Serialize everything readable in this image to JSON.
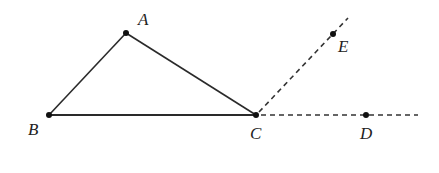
{
  "diagram": {
    "points": {
      "A": {
        "label": "A",
        "x": 126,
        "y": 33,
        "label_x": 138,
        "label_y": 25
      },
      "B": {
        "label": "B",
        "x": 49,
        "y": 115,
        "label_x": 28,
        "label_y": 135
      },
      "C": {
        "label": "C",
        "x": 256,
        "y": 115,
        "label_x": 250,
        "label_y": 139
      },
      "D": {
        "label": "D",
        "x": 366,
        "y": 115,
        "label_x": 360,
        "label_y": 139
      },
      "E": {
        "label": "E",
        "x": 333,
        "y": 34,
        "label_x": 338,
        "label_y": 52
      }
    },
    "segments": [
      {
        "from": "A",
        "to": "B",
        "style": "solid"
      },
      {
        "from": "A",
        "to": "C",
        "style": "solid"
      },
      {
        "from": "B",
        "to": "C",
        "style": "solid"
      }
    ],
    "rays": [
      {
        "from": "C",
        "through": "E",
        "end_x": 348,
        "end_y": 18,
        "style": "dashed"
      },
      {
        "from": "C",
        "through": "D",
        "end_x": 418,
        "end_y": 115,
        "style": "dashed"
      }
    ]
  }
}
